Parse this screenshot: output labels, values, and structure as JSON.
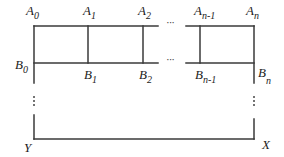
{
  "diagram": {
    "type": "ladder-grid",
    "top_labels": [
      {
        "base": "A",
        "sub": "0"
      },
      {
        "base": "A",
        "sub": "1"
      },
      {
        "base": "A",
        "sub": "2"
      },
      {
        "base": "A",
        "sub": "n-1"
      },
      {
        "base": "A",
        "sub": "n"
      }
    ],
    "middle_labels": [
      {
        "base": "B",
        "sub": "0"
      },
      {
        "base": "B",
        "sub": "1"
      },
      {
        "base": "B",
        "sub": "2"
      },
      {
        "base": "B",
        "sub": "n-1"
      },
      {
        "base": "B",
        "sub": "n"
      }
    ],
    "bottom_labels": {
      "left": "Y",
      "right": "X"
    },
    "ellipsis_horizontal": "···",
    "ellipsis_vertical": "⋮",
    "line_color": "#3a3a3a"
  }
}
